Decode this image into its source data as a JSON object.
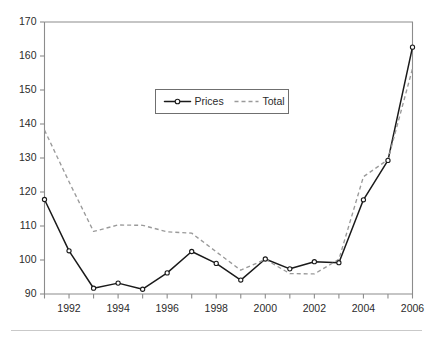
{
  "chart_data": {
    "type": "line",
    "title": "",
    "subtitle": "",
    "xlabel": "",
    "ylabel": "",
    "x": [
      1991,
      1992,
      1993,
      1994,
      1995,
      1996,
      1997,
      1998,
      1999,
      2000,
      2001,
      2002,
      2003,
      2004,
      2005,
      2006
    ],
    "xlim": [
      1991,
      2006
    ],
    "ylim": [
      90,
      170
    ],
    "ytick_labels": [
      "90",
      "100",
      "110",
      "120",
      "130",
      "140",
      "150",
      "160",
      "170"
    ],
    "ytick_values": [
      90,
      100,
      110,
      120,
      130,
      140,
      150,
      160,
      170
    ],
    "xtick_labels": [
      "1992",
      "1994",
      "1996",
      "1998",
      "2000",
      "2002",
      "2004",
      "2006"
    ],
    "xtick_values": [
      1992,
      1994,
      1996,
      1998,
      2000,
      2002,
      2004,
      2006
    ],
    "xminor_tick_values": [
      1991,
      1993,
      1995,
      1997,
      1999,
      2001,
      2003,
      2005
    ],
    "grid": false,
    "legend_position": "upper-center",
    "series": [
      {
        "name": "Prices",
        "style": "solid",
        "color": "#1a1a1a",
        "marker": "circle-open",
        "values": [
          117.8,
          102.7,
          91.7,
          93.2,
          91.4,
          96.2,
          102.5,
          99.0,
          94.1,
          100.3,
          97.4,
          99.5,
          99.2,
          117.7,
          129.3,
          162.6
        ]
      },
      {
        "name": "Total",
        "style": "dashed",
        "color": "#9a9a9a",
        "marker": "none",
        "values": [
          138.2,
          123.0,
          108.4,
          110.3,
          110.2,
          108.3,
          107.9,
          102.4,
          97.0,
          100.2,
          96.0,
          95.9,
          100.2,
          124.5,
          129.5,
          156.3
        ]
      }
    ],
    "annotations": []
  },
  "legend": {
    "entries": [
      {
        "label": "Prices",
        "icon": "solid-line-with-circle-marker"
      },
      {
        "label": "Total",
        "icon": "dashed-line"
      }
    ]
  },
  "colors": {
    "prices_line": "#1a1a1a",
    "total_line": "#9a9a9a",
    "axis": "#8c8c8c",
    "text": "#2b2b2b",
    "background": "#ffffff",
    "footer_rule": "#c9c9c9"
  }
}
